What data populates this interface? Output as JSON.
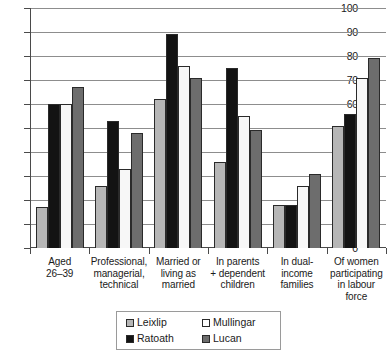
{
  "chart_data": {
    "type": "bar",
    "title": "",
    "subtitle": "",
    "xlabel": "",
    "ylabel": "",
    "ylim": [
      0,
      100
    ],
    "ytick_step": 10,
    "yticks": [
      0,
      10,
      20,
      30,
      40,
      50,
      60,
      70,
      80,
      90,
      100
    ],
    "grid": true,
    "legend_position": "bottom-center",
    "categories": [
      "Aged\n26–39",
      "Professional,\nmanagerial,\ntechnical",
      "Married or\nliving as\nmarried",
      "In parents\n+ dependent\nchildren",
      "In dual-\nincome\nfamilies",
      "Of women\nparticipating\nin labour force"
    ],
    "series": [
      {
        "name": "Leixlip",
        "color": "#b6b6b6",
        "values": [
          17,
          26,
          62,
          36,
          18,
          51
        ]
      },
      {
        "name": "Ratoath",
        "color": "#131313",
        "values": [
          60,
          53,
          89,
          75,
          18,
          56
        ]
      },
      {
        "name": "Mullingar",
        "color": "#ffffff",
        "values": [
          60,
          33,
          76,
          55,
          26,
          71
        ]
      },
      {
        "name": "Lucan",
        "color": "#6d6d6d",
        "values": [
          67,
          48,
          71,
          49,
          31,
          79
        ]
      }
    ]
  },
  "axes": {
    "y_tick_labels": [
      "100",
      "90",
      "80",
      "70",
      "60",
      "50",
      "40",
      "30",
      "20",
      "10",
      "0"
    ],
    "x_tick_labels": [
      [
        "Aged",
        "26–39"
      ],
      [
        "Professional,",
        "managerial,",
        "technical"
      ],
      [
        "Married or",
        "living as",
        "married"
      ],
      [
        "In parents",
        "+ dependent",
        "children"
      ],
      [
        "In dual-",
        "income",
        "families"
      ],
      [
        "Of women",
        "participating",
        "in labour force"
      ]
    ]
  },
  "legend": {
    "entries": [
      {
        "label": "Leixlip",
        "color": "#b6b6b6"
      },
      {
        "label": "Mullingar",
        "color": "#ffffff"
      },
      {
        "label": "Ratoath",
        "color": "#131313"
      },
      {
        "label": "Lucan",
        "color": "#6d6d6d"
      }
    ]
  }
}
